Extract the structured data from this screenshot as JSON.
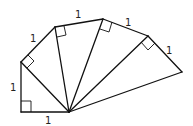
{
  "diagram": {
    "labels": {
      "base": "1",
      "leg1": "1",
      "leg2": "1",
      "leg3": "1",
      "leg4": "1",
      "leg5": "1"
    },
    "triangle_count": 5,
    "right_angle_markers": 5
  }
}
